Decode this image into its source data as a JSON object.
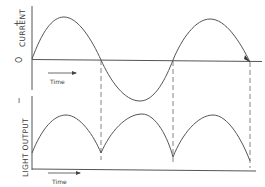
{
  "top_plot": {
    "y_label": "CURRENT",
    "plus_sign": "+",
    "zero_label": "O",
    "time_label": "Time"
  },
  "bottom_plot": {
    "y_label": "LIGHT OUTPUT",
    "tick_mark": "I",
    "time_label": "Time"
  },
  "colors": {
    "ink": "#555555",
    "background": "#ffffff"
  }
}
